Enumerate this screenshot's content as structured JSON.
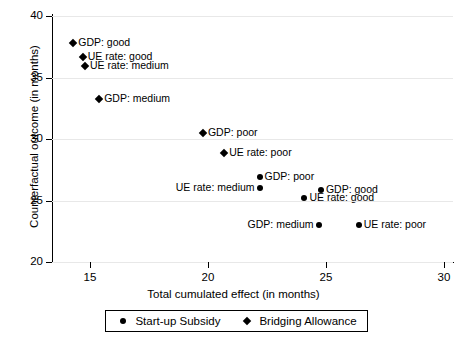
{
  "chart_data": {
    "type": "scatter",
    "title": "",
    "xlabel": "Total cumulated effect (in months)",
    "ylabel": "Counterfactual outcome (in months)",
    "xlim": [
      13.4,
      30.4
    ],
    "ylim": [
      20,
      40.2
    ],
    "xticks": [
      15,
      20,
      25,
      30
    ],
    "yticks": [
      20,
      25,
      30,
      35,
      40
    ],
    "grid": "horizontal",
    "legend_position": "below-axis",
    "series": [
      {
        "name": "Start-up Subsidy",
        "marker": "circle",
        "points": [
          {
            "label": "GDP: poor",
            "x": 22.2,
            "y": 26.9,
            "label_side": "right"
          },
          {
            "label": "UE rate: medium",
            "x": 22.2,
            "y": 26.0,
            "label_side": "left"
          },
          {
            "label": "GDP: good",
            "x": 24.8,
            "y": 25.9,
            "label_side": "right"
          },
          {
            "label": "UE rate: good",
            "x": 24.1,
            "y": 25.2,
            "label_side": "right"
          },
          {
            "label": "GDP: medium",
            "x": 24.7,
            "y": 23.0,
            "label_side": "left"
          },
          {
            "label": "UE rate: poor",
            "x": 26.4,
            "y": 23.0,
            "label_side": "right"
          }
        ]
      },
      {
        "name": "Bridging Allowance",
        "marker": "diamond",
        "points": [
          {
            "label": "GDP: good",
            "x": 14.3,
            "y": 37.8,
            "label_side": "right"
          },
          {
            "label": "UE rate: good",
            "x": 14.7,
            "y": 36.7,
            "label_side": "right"
          },
          {
            "label": "UE rate: medium",
            "x": 14.8,
            "y": 36.0,
            "label_side": "right"
          },
          {
            "label": "GDP: medium",
            "x": 15.4,
            "y": 33.3,
            "label_side": "right"
          },
          {
            "label": "GDP: poor",
            "x": 19.8,
            "y": 30.5,
            "label_side": "right"
          },
          {
            "label": "UE rate: poor",
            "x": 20.7,
            "y": 28.9,
            "label_side": "right"
          }
        ]
      }
    ]
  },
  "axes": {
    "x_ticks": [
      "15",
      "20",
      "25",
      "30"
    ],
    "y_ticks": [
      "40",
      "35",
      "30",
      "25",
      "20"
    ],
    "x_title": "Total cumulated effect (in months)",
    "y_title": "Counterfactual outcome (in months)"
  },
  "legend": {
    "entries": [
      {
        "symbol": "circle-marker-icon",
        "label": "Start-up Subsidy"
      },
      {
        "symbol": "diamond-marker-icon",
        "label": "Bridging Allowance"
      }
    ]
  }
}
